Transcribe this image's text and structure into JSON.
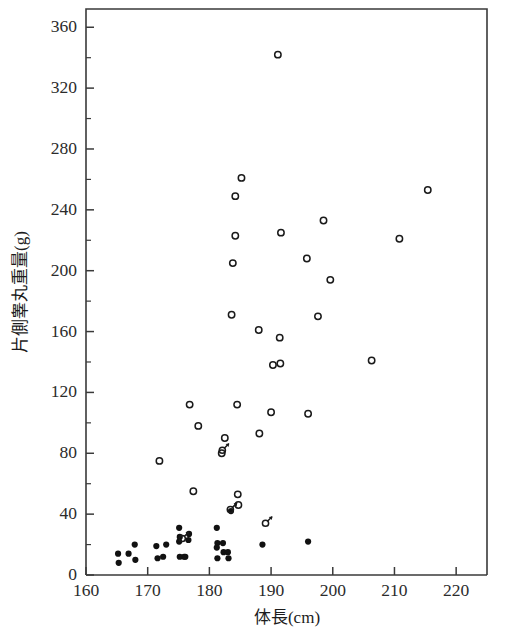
{
  "chart_data": {
    "type": "scatter",
    "title": "",
    "xlabel": "体長(cm)",
    "ylabel": "片側睾丸重量(g)",
    "xlim": [
      160,
      225
    ],
    "ylim": [
      0,
      372
    ],
    "xticks": [
      160,
      170,
      180,
      190,
      200,
      210,
      220
    ],
    "yticks": [
      0,
      40,
      80,
      120,
      160,
      200,
      240,
      280,
      320,
      360
    ],
    "xtick_labels": [
      "160",
      "170",
      "180",
      "190",
      "200",
      "210",
      "220"
    ],
    "ytick_labels": [
      "0",
      "40",
      "80",
      "120",
      "160",
      "200",
      "240",
      "280",
      "320",
      "360"
    ],
    "y_minor_ticks": [
      20,
      60,
      100,
      140,
      180,
      220,
      260,
      300,
      340
    ],
    "grid": false,
    "legend": "none",
    "axis_style": "open-frame",
    "series": [
      {
        "name": "open-circle",
        "marker": "open-circle",
        "color": "#1a1a1a",
        "points": [
          [
            191.1,
            342
          ],
          [
            185.2,
            261
          ],
          [
            184.2,
            249
          ],
          [
            215.4,
            253
          ],
          [
            198.5,
            233
          ],
          [
            191.6,
            225
          ],
          [
            184.2,
            223
          ],
          [
            210.8,
            221
          ],
          [
            195.8,
            208
          ],
          [
            199.6,
            194
          ],
          [
            183.8,
            205
          ],
          [
            197.6,
            170
          ],
          [
            183.6,
            171
          ],
          [
            188.0,
            161
          ],
          [
            191.4,
            156
          ],
          [
            206.3,
            141
          ],
          [
            190.3,
            138
          ],
          [
            191.5,
            139
          ],
          [
            176.8,
            112
          ],
          [
            184.5,
            112
          ],
          [
            190.0,
            107
          ],
          [
            196.0,
            106
          ],
          [
            178.2,
            98
          ],
          [
            188.1,
            93
          ],
          [
            182.5,
            90
          ],
          [
            182.0,
            80
          ],
          [
            171.9,
            75
          ],
          [
            177.4,
            55
          ],
          [
            184.6,
            53
          ],
          [
            184.7,
            46
          ]
        ]
      },
      {
        "name": "filled-dot",
        "marker": "filled-dot",
        "color": "#111111",
        "points": [
          [
            165.2,
            14
          ],
          [
            165.3,
            8
          ],
          [
            166.9,
            14
          ],
          [
            167.9,
            20
          ],
          [
            168.0,
            10
          ],
          [
            171.4,
            19
          ],
          [
            171.6,
            11
          ],
          [
            172.5,
            12
          ],
          [
            173.0,
            20
          ],
          [
            175.1,
            31
          ],
          [
            175.2,
            25
          ],
          [
            175.1,
            22
          ],
          [
            175.2,
            12
          ],
          [
            175.9,
            12
          ],
          [
            176.1,
            12
          ],
          [
            176.7,
            27
          ],
          [
            176.6,
            23
          ],
          [
            181.2,
            31
          ],
          [
            181.3,
            21
          ],
          [
            181.2,
            18
          ],
          [
            181.3,
            11
          ],
          [
            182.2,
            21
          ],
          [
            182.3,
            15
          ],
          [
            183.0,
            15
          ],
          [
            183.1,
            11
          ],
          [
            183.5,
            42
          ],
          [
            188.6,
            20
          ],
          [
            196.0,
            22
          ]
        ]
      },
      {
        "name": "mars-symbol",
        "marker": "mars",
        "color": "#1a1a1a",
        "points": [
          [
            182.1,
            82
          ],
          [
            175.6,
            24
          ],
          [
            189.1,
            34
          ],
          [
            183.4,
            43
          ]
        ]
      }
    ]
  },
  "geometry": {
    "plot_left": 86,
    "plot_right": 487,
    "plot_top": 9,
    "plot_bottom": 575
  }
}
